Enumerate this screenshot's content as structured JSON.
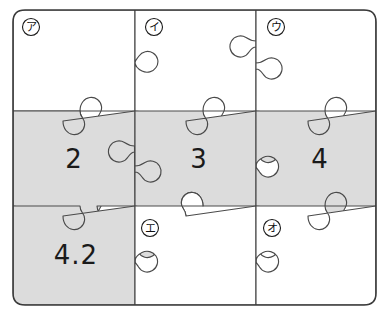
{
  "figure": {
    "kind": "jigsaw-puzzle-grid",
    "rows": 3,
    "columns": 3,
    "background_color": "#ffffff",
    "shaded_color": "#dcdcdc",
    "unshaded_color": "#ffffff",
    "outline_color": "#4a4a4a",
    "frame_color": "#3a3a3a"
  },
  "pieces": [
    {
      "id": "r1c1",
      "row": 1,
      "col": 1,
      "value": "",
      "shaded": false
    },
    {
      "id": "r1c2",
      "row": 1,
      "col": 2,
      "value": "",
      "shaded": false
    },
    {
      "id": "r1c3",
      "row": 1,
      "col": 3,
      "value": "",
      "shaded": false
    },
    {
      "id": "r2c1",
      "row": 2,
      "col": 1,
      "value": "2",
      "shaded": true
    },
    {
      "id": "r2c2",
      "row": 2,
      "col": 2,
      "value": "3",
      "shaded": true
    },
    {
      "id": "r2c3",
      "row": 2,
      "col": 3,
      "value": "4",
      "shaded": true
    },
    {
      "id": "r3c1",
      "row": 3,
      "col": 1,
      "value": "4.2",
      "shaded": true
    },
    {
      "id": "r3c2",
      "row": 3,
      "col": 2,
      "value": "",
      "shaded": false
    },
    {
      "id": "r3c3",
      "row": 3,
      "col": 3,
      "value": "",
      "shaded": false
    }
  ],
  "values": {
    "r2c1": "2",
    "r2c2": "3",
    "r2c3": "4",
    "r3c1": "4.2"
  },
  "markers": [
    {
      "id": "marker-a",
      "label": "ア",
      "piece": "r1c1",
      "x": 31,
      "y": 27
    },
    {
      "id": "marker-i",
      "label": "イ",
      "piece": "r1c2",
      "x": 154,
      "y": 27
    },
    {
      "id": "marker-u",
      "label": "ウ",
      "piece": "r1c3",
      "x": 276,
      "y": 27
    },
    {
      "id": "marker-e",
      "label": "エ",
      "piece": "r3c2",
      "x": 150,
      "y": 228
    },
    {
      "id": "marker-o",
      "label": "オ",
      "piece": "r3c3",
      "x": 272,
      "y": 228
    }
  ]
}
